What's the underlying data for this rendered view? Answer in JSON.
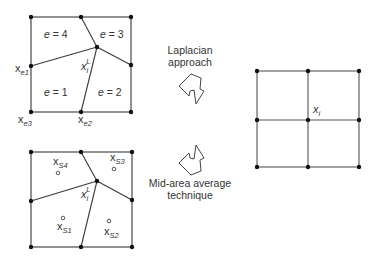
{
  "diagram": {
    "top_mesh": {
      "element_labels": [
        "e = 4",
        "e = 3",
        "e = 1",
        "e = 2"
      ],
      "node_labels": {
        "interior": {
          "base": "x",
          "sub": "i",
          "sup": "L"
        },
        "e1": {
          "base": "x",
          "sub": "e1"
        },
        "e2": {
          "base": "x",
          "sub": "e2"
        },
        "e3": {
          "base": "x",
          "sub": "e3"
        }
      }
    },
    "bottom_mesh": {
      "centroid_labels": [
        {
          "base": "x",
          "sub": "S4"
        },
        {
          "base": "x",
          "sub": "S3"
        },
        {
          "base": "x",
          "sub": "S1"
        },
        {
          "base": "x",
          "sub": "S2"
        }
      ],
      "interior_label": {
        "base": "x",
        "sub": "i",
        "sup": "L"
      }
    },
    "methods": [
      {
        "line1": "Laplacian",
        "line2": "approach"
      },
      {
        "line1": "Mid-area average",
        "line2": "technique"
      }
    ],
    "result_grid": {
      "center_label": {
        "base": "x",
        "sub": "i"
      }
    },
    "colors": {
      "line": "#3a3a3a",
      "node": "#111111",
      "text": "#333333",
      "background": "#ffffff"
    }
  }
}
